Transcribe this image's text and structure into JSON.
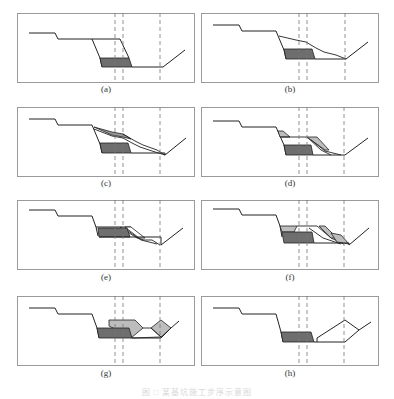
{
  "figure": {
    "caption": "图 □ 某基坑施工步序示意图",
    "colors": {
      "frame": "#9a9a9a",
      "profile": "#222222",
      "dashed": "#777777",
      "dark_fill": "#6e6e6e",
      "light_fill": "#bdbdbd"
    },
    "panels": [
      {
        "id": "a",
        "label": "(a)"
      },
      {
        "id": "b",
        "label": "(b)"
      },
      {
        "id": "c",
        "label": "(c)"
      },
      {
        "id": "d",
        "label": "(d)"
      },
      {
        "id": "e",
        "label": "(e)"
      },
      {
        "id": "f",
        "label": "(f)"
      },
      {
        "id": "g",
        "label": "(g)"
      },
      {
        "id": "h",
        "label": "(h)"
      }
    ]
  }
}
